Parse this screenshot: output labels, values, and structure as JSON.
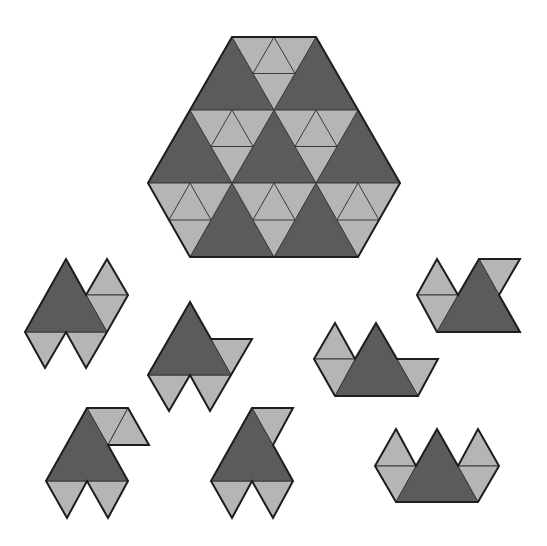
{
  "colors": {
    "dark": "#5b5b5b",
    "light": "#b5b5b5",
    "inner": "#3a3a3a",
    "outline": "#1e1e1e",
    "background": "#ffffff"
  },
  "target": {
    "name": "hexagon-target-shape",
    "outline": [
      [
        232,
        37
      ],
      [
        316,
        37
      ],
      [
        400,
        183
      ],
      [
        358,
        257
      ],
      [
        190,
        257
      ],
      [
        148,
        183
      ]
    ],
    "dark": [
      [
        [
          232,
          37
        ],
        [
          190,
          110
        ],
        [
          274,
          110
        ]
      ],
      [
        [
          316,
          37
        ],
        [
          274,
          110
        ],
        [
          358,
          110
        ]
      ],
      [
        [
          190,
          110
        ],
        [
          148,
          183
        ],
        [
          232,
          183
        ]
      ],
      [
        [
          274,
          110
        ],
        [
          232,
          183
        ],
        [
          316,
          183
        ]
      ],
      [
        [
          358,
          110
        ],
        [
          316,
          183
        ],
        [
          400,
          183
        ]
      ],
      [
        [
          232,
          183
        ],
        [
          190,
          257
        ],
        [
          274,
          257
        ]
      ],
      [
        [
          316,
          183
        ],
        [
          274,
          257
        ],
        [
          358,
          257
        ]
      ]
    ],
    "light_subdivided": [
      [
        [
          232,
          37
        ],
        [
          316,
          37
        ],
        [
          274,
          110
        ]
      ],
      [
        [
          190,
          110
        ],
        [
          274,
          110
        ],
        [
          232,
          183
        ]
      ],
      [
        [
          274,
          110
        ],
        [
          358,
          110
        ],
        [
          316,
          183
        ]
      ],
      [
        [
          148,
          183
        ],
        [
          232,
          183
        ],
        [
          190,
          257
        ]
      ],
      [
        [
          232,
          183
        ],
        [
          316,
          183
        ],
        [
          274,
          257
        ]
      ],
      [
        [
          316,
          183
        ],
        [
          400,
          183
        ],
        [
          358,
          257
        ]
      ]
    ]
  },
  "pieces": [
    {
      "name": "piece-1",
      "dark": [
        [
          [
            66,
            259
          ],
          [
            25,
            332
          ],
          [
            107,
            332
          ]
        ]
      ],
      "light": [
        [
          [
            25,
            332
          ],
          [
            66,
            332
          ],
          [
            45,
            368
          ]
        ],
        [
          [
            66,
            332
          ],
          [
            107,
            332
          ],
          [
            86,
            368
          ]
        ],
        [
          [
            107,
            259
          ],
          [
            86,
            295
          ],
          [
            128,
            295
          ]
        ],
        [
          [
            86,
            295
          ],
          [
            128,
            295
          ],
          [
            107,
            332
          ]
        ]
      ],
      "outline": [
        [
          66,
          259
        ],
        [
          86,
          295
        ],
        [
          107,
          259
        ],
        [
          128,
          295
        ],
        [
          107,
          332
        ],
        [
          86,
          368
        ],
        [
          66,
          332
        ],
        [
          45,
          368
        ],
        [
          25,
          332
        ]
      ]
    },
    {
      "name": "piece-2",
      "dark": [
        [
          [
            190,
            302
          ],
          [
            148,
            375
          ],
          [
            231,
            375
          ]
        ]
      ],
      "light": [
        [
          [
            211,
            339
          ],
          [
            252,
            339
          ],
          [
            231,
            375
          ]
        ],
        [
          [
            148,
            375
          ],
          [
            190,
            375
          ],
          [
            169,
            411
          ]
        ],
        [
          [
            190,
            375
          ],
          [
            231,
            375
          ],
          [
            210,
            411
          ]
        ]
      ],
      "outline": [
        [
          190,
          302
        ],
        [
          211,
          339
        ],
        [
          252,
          339
        ],
        [
          231,
          375
        ],
        [
          210,
          411
        ],
        [
          190,
          375
        ],
        [
          169,
          411
        ],
        [
          148,
          375
        ]
      ]
    },
    {
      "name": "piece-3",
      "dark": [
        [
          [
            479,
            259
          ],
          [
            437,
            332
          ],
          [
            520,
            332
          ]
        ]
      ],
      "light": [
        [
          [
            437,
            259
          ],
          [
            417,
            295
          ],
          [
            458,
            295
          ]
        ],
        [
          [
            417,
            295
          ],
          [
            458,
            295
          ],
          [
            437,
            332
          ]
        ],
        [
          [
            479,
            259
          ],
          [
            520,
            259
          ],
          [
            499,
            295
          ]
        ]
      ],
      "outline": [
        [
          437,
          259
        ],
        [
          458,
          295
        ],
        [
          479,
          259
        ],
        [
          520,
          259
        ],
        [
          499,
          295
        ],
        [
          520,
          332
        ],
        [
          437,
          332
        ],
        [
          417,
          295
        ]
      ]
    },
    {
      "name": "piece-4",
      "dark": [
        [
          [
            376,
            323
          ],
          [
            335,
            396
          ],
          [
            418,
            396
          ]
        ]
      ],
      "light": [
        [
          [
            335,
            323
          ],
          [
            314,
            359
          ],
          [
            355,
            359
          ]
        ],
        [
          [
            314,
            359
          ],
          [
            355,
            359
          ],
          [
            335,
            396
          ]
        ],
        [
          [
            397,
            359
          ],
          [
            438,
            359
          ],
          [
            418,
            396
          ]
        ]
      ],
      "outline": [
        [
          335,
          323
        ],
        [
          355,
          359
        ],
        [
          376,
          323
        ],
        [
          397,
          359
        ],
        [
          438,
          359
        ],
        [
          418,
          396
        ],
        [
          335,
          396
        ],
        [
          314,
          359
        ]
      ]
    },
    {
      "name": "piece-5",
      "dark": [
        [
          [
            87,
            408
          ],
          [
            46,
            481
          ],
          [
            128,
            481
          ]
        ]
      ],
      "light": [
        [
          [
            87,
            408
          ],
          [
            128,
            408
          ],
          [
            108,
            445
          ]
        ],
        [
          [
            128,
            408
          ],
          [
            108,
            445
          ],
          [
            149,
            445
          ]
        ],
        [
          [
            46,
            481
          ],
          [
            87,
            481
          ],
          [
            67,
            518
          ]
        ],
        [
          [
            87,
            481
          ],
          [
            128,
            481
          ],
          [
            108,
            518
          ]
        ]
      ],
      "outline": [
        [
          87,
          408
        ],
        [
          128,
          408
        ],
        [
          149,
          445
        ],
        [
          108,
          445
        ],
        [
          128,
          481
        ],
        [
          108,
          518
        ],
        [
          87,
          481
        ],
        [
          67,
          518
        ],
        [
          46,
          481
        ]
      ]
    },
    {
      "name": "piece-6",
      "dark": [
        [
          [
            252,
            408
          ],
          [
            211,
            481
          ],
          [
            293,
            481
          ]
        ]
      ],
      "light": [
        [
          [
            252,
            408
          ],
          [
            293,
            408
          ],
          [
            273,
            445
          ]
        ],
        [
          [
            211,
            481
          ],
          [
            252,
            481
          ],
          [
            232,
            518
          ]
        ],
        [
          [
            252,
            481
          ],
          [
            293,
            481
          ],
          [
            273,
            518
          ]
        ]
      ],
      "outline": [
        [
          252,
          408
        ],
        [
          293,
          408
        ],
        [
          273,
          445
        ],
        [
          293,
          481
        ],
        [
          273,
          518
        ],
        [
          252,
          481
        ],
        [
          232,
          518
        ],
        [
          211,
          481
        ]
      ]
    },
    {
      "name": "piece-7",
      "dark": [
        [
          [
            437,
            429
          ],
          [
            396,
            502
          ],
          [
            478,
            502
          ]
        ]
      ],
      "light": [
        [
          [
            396,
            429
          ],
          [
            375,
            466
          ],
          [
            416,
            466
          ]
        ],
        [
          [
            375,
            466
          ],
          [
            416,
            466
          ],
          [
            396,
            502
          ]
        ],
        [
          [
            478,
            429
          ],
          [
            458,
            466
          ],
          [
            499,
            466
          ]
        ],
        [
          [
            458,
            466
          ],
          [
            499,
            466
          ],
          [
            478,
            502
          ]
        ]
      ],
      "outline": [
        [
          396,
          429
        ],
        [
          416,
          466
        ],
        [
          437,
          429
        ],
        [
          458,
          466
        ],
        [
          478,
          429
        ],
        [
          499,
          466
        ],
        [
          478,
          502
        ],
        [
          396,
          502
        ],
        [
          375,
          466
        ]
      ]
    }
  ]
}
